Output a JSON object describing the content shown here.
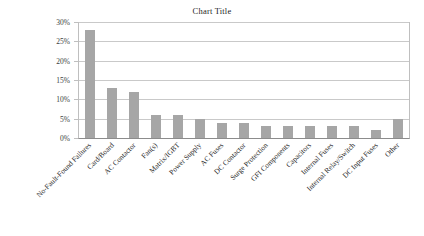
{
  "chart_data": {
    "type": "bar",
    "title": "Chart Title",
    "xlabel": "",
    "ylabel": "",
    "ylim": [
      0,
      30
    ],
    "y_unit": "%",
    "grid": true,
    "legend": false,
    "bar_color": "#a6a6a6",
    "y_ticks": [
      "0%",
      "5%",
      "10%",
      "15%",
      "20%",
      "25%",
      "30%"
    ],
    "y_tick_values": [
      0,
      5,
      10,
      15,
      20,
      25,
      30
    ],
    "categories": [
      "No-Fault-Found Failures",
      "Card/Board",
      "AC Contactor",
      "Fan(s)",
      "Matrix/IGBT",
      "Power Supply",
      "AC Fuses",
      "DC Contactor",
      "Surge Protection",
      "GFI Components",
      "Capacitors",
      "Internal Fuses",
      "Internal Relay/Switch",
      "DC Input Fuses",
      "Other"
    ],
    "values": [
      28,
      13,
      12,
      6,
      6,
      5,
      4,
      4,
      3,
      3,
      3,
      3,
      3,
      2,
      5
    ]
  }
}
